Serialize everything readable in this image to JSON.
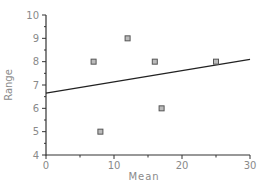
{
  "chart_data": {
    "type": "scatter",
    "title": "",
    "xlabel": "Mean",
    "ylabel": "Range",
    "xlim": [
      0,
      30
    ],
    "ylim": [
      4,
      10
    ],
    "x_ticks": [
      0,
      10,
      20,
      30
    ],
    "x_minor_ticks": [
      5,
      15,
      25
    ],
    "y_ticks": [
      4,
      5,
      6,
      7,
      8,
      9,
      10
    ],
    "grid": false,
    "legend": null,
    "series": [
      {
        "name": "points",
        "marker": "square",
        "points": [
          {
            "x": 7,
            "y": 8
          },
          {
            "x": 12,
            "y": 9
          },
          {
            "x": 16,
            "y": 8
          },
          {
            "x": 8,
            "y": 5
          },
          {
            "x": 17,
            "y": 6
          },
          {
            "x": 25,
            "y": 8
          }
        ]
      },
      {
        "name": "regression-line",
        "type": "line",
        "points": [
          {
            "x": 0,
            "y": 6.65
          },
          {
            "x": 30,
            "y": 8.1
          }
        ]
      }
    ],
    "colors": {
      "axis": "#333333",
      "tick_label": "#8a8a8a",
      "marker_edge": "#555555",
      "marker_fill": "#bbbbbb",
      "line": "#222222"
    }
  }
}
